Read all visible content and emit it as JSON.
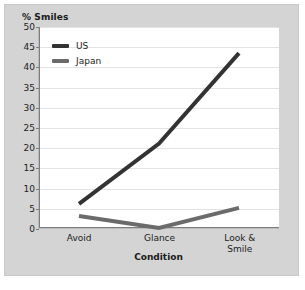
{
  "chart_data": {
    "type": "line",
    "title": "",
    "ylabel": "% Smiles",
    "xlabel": "Condition",
    "categories": [
      "Avoid",
      "Glance",
      "Look &\nSmile"
    ],
    "ylim": [
      0,
      50
    ],
    "ytick_step": 5,
    "yticks": [
      50,
      45,
      40,
      35,
      30,
      25,
      20,
      15,
      10,
      5,
      0
    ],
    "grid": true,
    "legend_position": "top-left",
    "series": [
      {
        "name": "US",
        "values": [
          6,
          21,
          43.5
        ],
        "color": "#333333"
      },
      {
        "name": "Japan",
        "values": [
          3,
          0,
          5
        ],
        "color": "#6b6b6b"
      }
    ]
  },
  "figure": {
    "y_axis_title": "% Smiles",
    "x_axis_title": "Condition",
    "panel_color": "#d4d4d4",
    "plot_bg_color": "#ffffff",
    "gridline_color": "#e3e3e3",
    "axis_color": "#7d7d7d"
  },
  "legend": {
    "items": [
      {
        "label": "US",
        "color": "#333333"
      },
      {
        "label": "Japan",
        "color": "#6b6b6b"
      }
    ]
  }
}
